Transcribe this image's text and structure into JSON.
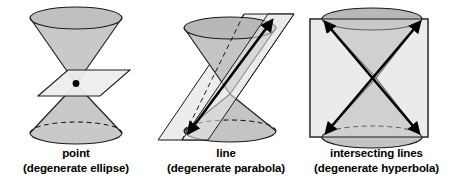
{
  "figure": {
    "background_color": "#ffffff",
    "panels": [
      {
        "id": "point",
        "caption_main": "point",
        "caption_sub": "(degenerate ellipse)",
        "description": "A plane through the apex of a double cone meeting it at a single point",
        "intersection_type": "point",
        "marker": "apex-point-dot",
        "plane_shape": "parallelogram",
        "plane_orientation": "horizontal-through-apex"
      },
      {
        "id": "line",
        "caption_main": "line",
        "caption_sub": "(degenerate parabola)",
        "description": "A plane tangent to the double cone along a single generator line",
        "intersection_type": "line",
        "marker": "double-headed-arrow",
        "plane_shape": "parallelogram",
        "plane_orientation": "slanted-tangent"
      },
      {
        "id": "intersecting-lines",
        "caption_main": "intersecting lines",
        "caption_sub": "(degenerate hyperbola)",
        "description": "A vertical plane through the apex of a double cone meeting it in two intersecting lines",
        "intersection_type": "intersecting lines",
        "marker": "crossed-double-headed-arrows",
        "plane_shape": "rectangle",
        "plane_orientation": "vertical-through-apex"
      }
    ],
    "colors": {
      "outline": "#1a1a1a",
      "cone_fill": "#c9c9c9",
      "cone_fill_dark": "#bdbdbd",
      "cone_rim_fill": "#b5b5b5",
      "plane_fill": "#ededed",
      "plane_fill_alt": "#e4e4e4",
      "text": "#000000",
      "background": "#ffffff"
    }
  }
}
